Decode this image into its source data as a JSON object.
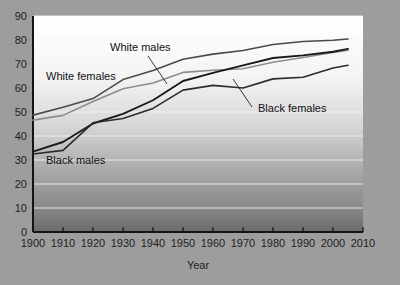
{
  "chart_data": {
    "type": "line",
    "title": "",
    "xlabel": "Year",
    "ylabel": "",
    "xlim": [
      1900,
      2010
    ],
    "ylim": [
      0,
      90
    ],
    "grid": true,
    "legend_position": "inline-annotations",
    "xticks": [
      "1900",
      "1910",
      "1920",
      "1930",
      "1940",
      "1950",
      "1960",
      "1970",
      "1980",
      "1990",
      "2000",
      "2010"
    ],
    "yticks": [
      "0",
      "10",
      "20",
      "30",
      "40",
      "50",
      "60",
      "70",
      "80",
      "90"
    ],
    "x": [
      1900,
      1910,
      1920,
      1930,
      1940,
      1950,
      1960,
      1970,
      1980,
      1990,
      2000,
      2005
    ],
    "series": [
      {
        "name": "White females",
        "color": "#4a4a4a",
        "width": 1.6,
        "values": [
          48.7,
          52.0,
          55.6,
          63.5,
          67.3,
          72.0,
          74.1,
          75.6,
          78.1,
          79.4,
          79.9,
          80.4
        ]
      },
      {
        "name": "White males",
        "color": "#8d8d8d",
        "width": 1.6,
        "values": [
          46.6,
          48.6,
          54.4,
          59.7,
          62.1,
          66.5,
          67.4,
          68.0,
          70.7,
          72.7,
          74.8,
          75.7
        ]
      },
      {
        "name": "Black females",
        "color": "#1a1a1a",
        "width": 1.9,
        "values": [
          33.5,
          37.5,
          45.2,
          49.2,
          54.9,
          62.9,
          66.3,
          69.4,
          72.5,
          73.6,
          75.1,
          76.3
        ]
      },
      {
        "name": "Black males",
        "color": "#2b2b2b",
        "width": 1.6,
        "values": [
          32.5,
          34.0,
          45.5,
          47.3,
          51.5,
          59.1,
          61.1,
          60.0,
          63.8,
          64.5,
          68.3,
          69.5
        ]
      }
    ],
    "annotations": [
      {
        "name": "white-males",
        "label": "White males",
        "text_x": 110,
        "text_y": 51,
        "leader": [
          [
            148,
            56
          ],
          [
            167,
            84
          ]
        ]
      },
      {
        "name": "white-females",
        "label": "White females",
        "text_x": 46,
        "text_y": 80,
        "leader": null
      },
      {
        "name": "black-females",
        "label": "Black females",
        "text_x": 258,
        "text_y": 112,
        "leader": [
          [
            252,
            107
          ],
          [
            233,
            79
          ]
        ]
      },
      {
        "name": "black-males",
        "label": "Black males",
        "text_x": 46,
        "text_y": 164,
        "leader": null
      }
    ]
  },
  "colors": {
    "page_background": "#9d9d9d",
    "plot_top": "#fdfdfd",
    "plot_bottom": "#6f6f6f",
    "axis": "#1a1a1a",
    "grid": "#f2f2f2"
  }
}
